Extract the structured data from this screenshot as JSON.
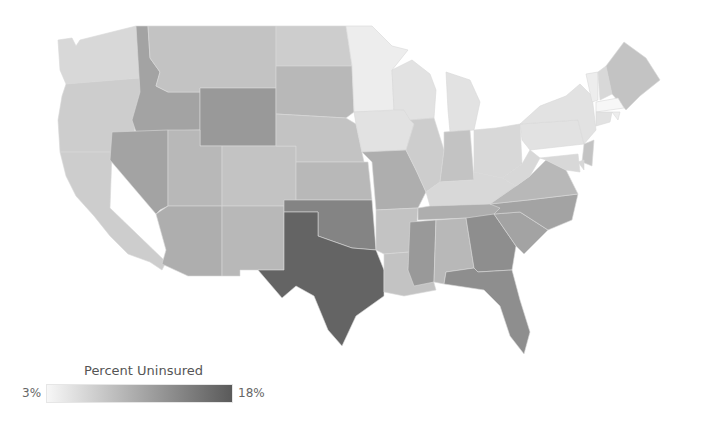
{
  "chart_data": {
    "type": "choropleth",
    "title": "",
    "region": "United States (contiguous)",
    "metric": "Percent Uninsured",
    "color_scale": {
      "min_label": "3%",
      "max_label": "18%",
      "min_value": 3,
      "max_value": 18,
      "min_color": "#f7f7f7",
      "max_color": "#5a5a5a"
    },
    "legend": {
      "title": "Percent Uninsured",
      "position": "bottom-left"
    },
    "values": {
      "WA": 6,
      "OR": 7,
      "CA": 7,
      "ID": 11,
      "NV": 11,
      "MT": 8,
      "WY": 12,
      "UT": 9,
      "AZ": 10,
      "CO": 8,
      "NM": 9,
      "ND": 7,
      "SD": 9,
      "NE": 8,
      "KS": 9,
      "OK": 14,
      "TX": 17,
      "MN": 4,
      "IA": 5,
      "MO": 10,
      "AR": 8,
      "LA": 8,
      "WI": 5,
      "IL": 7,
      "MI": 5,
      "IN": 8,
      "OH": 6,
      "KY": 6,
      "TN": 10,
      "MS": 12,
      "AL": 9,
      "GA": 13,
      "FL": 13,
      "SC": 11,
      "NC": 11,
      "VA": 9,
      "WV": 6,
      "PA": 5,
      "NY": 5,
      "VT": 4,
      "NH": 6,
      "ME": 8,
      "MA": 3,
      "RI": 4,
      "CT": 5,
      "NJ": 8,
      "DE": 6,
      "MD": 6
    }
  },
  "legend": {
    "title": "Percent Uninsured",
    "min": "3%",
    "max": "18%"
  }
}
